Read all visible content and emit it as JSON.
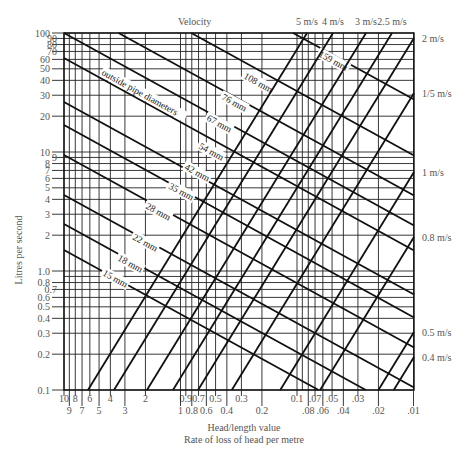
{
  "chart_data": {
    "type": "line",
    "title": "Velocity",
    "xlabel": "Head/length value",
    "xlabel2": "Rate of loss of head per metre",
    "ylabel": "Litres per second",
    "scale": "log-log",
    "xlim": [
      10,
      0.01
    ],
    "ylim": [
      0.1,
      100
    ],
    "grid": true,
    "y_ticks_major": [
      "100",
      "90",
      "80",
      "70",
      "60",
      "50",
      "40",
      "30",
      "20",
      "10",
      "9",
      "8",
      "7",
      "6",
      "5",
      "4",
      "3",
      "2",
      "1.0",
      "0.8",
      "0.7",
      "0.6",
      "0.5",
      "0.4",
      "0.3",
      "0.2",
      "0.1"
    ],
    "x_ticks_row1": [
      "10",
      "8",
      "6",
      "4",
      "2",
      "0.9",
      "0.7",
      "0.5",
      "0.3",
      "0.1",
      ".07",
      ".05",
      ".03"
    ],
    "x_ticks_row2": [
      "9",
      "7",
      "5",
      "3",
      "1",
      "0.8",
      "0.6",
      "0.4",
      "0.2",
      ".08",
      ".06",
      ".04",
      ".02",
      ".01"
    ],
    "pipe_series_label": "outside pipe diameters",
    "pipe_diameters": [
      {
        "name": "15 mm",
        "y_at_left_px": 250
      },
      {
        "name": "18 mm",
        "y_at_left_px": 224
      },
      {
        "name": "22 mm",
        "y_at_left_px": 195
      },
      {
        "name": "28 mm",
        "y_at_left_px": 155
      },
      {
        "name": "35 mm",
        "y_at_left_px": 125
      },
      {
        "name": "42 mm",
        "y_at_left_px": 102
      },
      {
        "name": "54 mm",
        "y_at_left_px": 58
      },
      {
        "name": "67 mm",
        "y_at_left_px": 33
      },
      {
        "name": "76 mm",
        "y_at_left_px": 3
      },
      {
        "name": "108 mm",
        "y_at_left_px": -37
      },
      {
        "name": "159 mm",
        "y_at_left_px": -93
      }
    ],
    "velocity_lines_right": [
      {
        "name": "2 m/s",
        "y_px": 38
      },
      {
        "name": "1/5 m/s",
        "y_px": 93
      },
      {
        "name": "1 m/s",
        "y_px": 172
      },
      {
        "name": "0.8 m/s",
        "y_px": 237
      },
      {
        "name": "0.5 m/s",
        "y_px": 332
      },
      {
        "name": "0.4 m/s",
        "y_px": 357
      }
    ],
    "velocity_lines_top": [
      {
        "name": "5 m/s",
        "x_px": 307
      },
      {
        "name": "4 m/s",
        "x_px": 333
      },
      {
        "name": "3 m/s",
        "x_px": 366
      },
      {
        "name": "2.5 m/s",
        "x_px": 392
      }
    ]
  }
}
